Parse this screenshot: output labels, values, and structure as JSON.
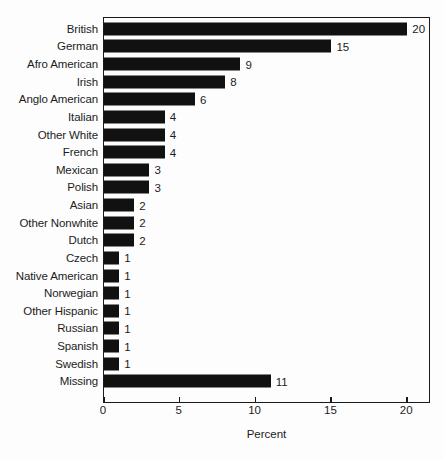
{
  "chart_data": {
    "type": "bar",
    "orientation": "horizontal",
    "title": "",
    "xlabel": "Percent",
    "ylabel": "",
    "xlim": [
      0,
      21.5
    ],
    "xticks": [
      0,
      5,
      10,
      15,
      20
    ],
    "xtick_labels": [
      "0",
      "5",
      "10",
      "15",
      "20"
    ],
    "grid": false,
    "legend": null,
    "bar_color": "#111111",
    "background_color": "#fdfdfd",
    "axis_color": "#1a1a1a",
    "categories": [
      "British",
      "German",
      "Afro American",
      "Irish",
      "Anglo American",
      "Italian",
      "Other White",
      "French",
      "Mexican",
      "Polish",
      "Asian",
      "Other Nonwhite",
      "Dutch",
      "Czech",
      "Native American",
      "Norwegian",
      "Other Hispanic",
      "Russian",
      "Spanish",
      "Swedish",
      "Missing"
    ],
    "values": [
      20,
      15,
      9,
      8,
      6,
      4,
      4,
      4,
      3,
      3,
      2,
      2,
      2,
      1,
      1,
      1,
      1,
      1,
      1,
      1,
      11
    ],
    "value_labels": [
      "20",
      "15",
      "9",
      "8",
      "6",
      "4",
      "4",
      "4",
      "3",
      "3",
      "2",
      "2",
      "2",
      "1",
      "1",
      "1",
      "1",
      "1",
      "1",
      "1",
      "11"
    ]
  }
}
